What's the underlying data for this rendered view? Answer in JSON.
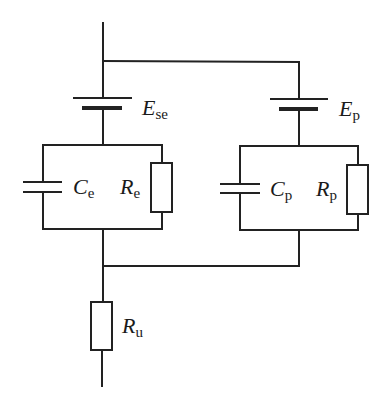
{
  "diagram": {
    "type": "electrical-equivalent-circuit",
    "colors": {
      "line": "#222222",
      "background": "#ffffff",
      "text": "#1a1a1a"
    },
    "components": {
      "battery_left": {
        "symbol": "E",
        "subscript": "se"
      },
      "battery_right": {
        "symbol": "E",
        "subscript": "p"
      },
      "capacitor_left": {
        "symbol": "C",
        "subscript": "e"
      },
      "resistor_left": {
        "symbol": "R",
        "subscript": "e"
      },
      "capacitor_right": {
        "symbol": "C",
        "subscript": "p"
      },
      "resistor_right": {
        "symbol": "R",
        "subscript": "p"
      },
      "resistor_bottom": {
        "symbol": "R",
        "subscript": "u"
      }
    },
    "topology": [
      "Top terminal splits into two parallel branches",
      "Left branch: E_se in series with (C_e || R_e)",
      "Right branch: E_p in series with (C_p || R_p)",
      "Branches rejoin and pass through R_u to bottom terminal"
    ]
  }
}
